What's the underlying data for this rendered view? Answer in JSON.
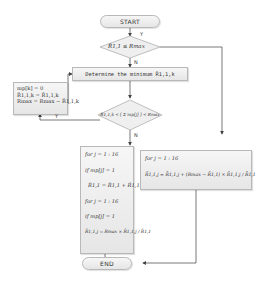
{
  "diagram": {
    "type": "flowchart",
    "start_label": "START",
    "end_label": "END",
    "decision1": {
      "text": "R̄1,1 ≤ Rmax",
      "yes": "Y",
      "no": "N"
    },
    "process1": {
      "text": "Determine the minimum R̄1,1,k"
    },
    "update_box": {
      "lines": [
        "mp[k] = 0",
        "R̄1,1,k = R̄1,1,k",
        "Rmax = Rmax − R̄1,1,k"
      ]
    },
    "decision2": {
      "text": "R̄1,1,k < [ Σ mp[j] ] < Rmax",
      "sum_from": "j=1",
      "sum_to": "k",
      "yes": "Y",
      "no": "N"
    },
    "left_loop_box": {
      "lines": [
        "for   j = 1 : 16",
        "if   mp[j] = 1",
        "R̄1,1 = R̄1,1 + R̄1,1,j",
        "for   j = 1 : 16",
        "if   mp[j] = 1",
        "R̄1,1,j = Rmax × R̄1,1,j / R̄1,1"
      ]
    },
    "right_loop_box": {
      "lines": [
        "for   j = 1 : 16",
        "R̄1,1,j = R̄1,1,j + (Rmax − R̄1,1) × R̄1,1,j / R̄1,1"
      ]
    }
  }
}
